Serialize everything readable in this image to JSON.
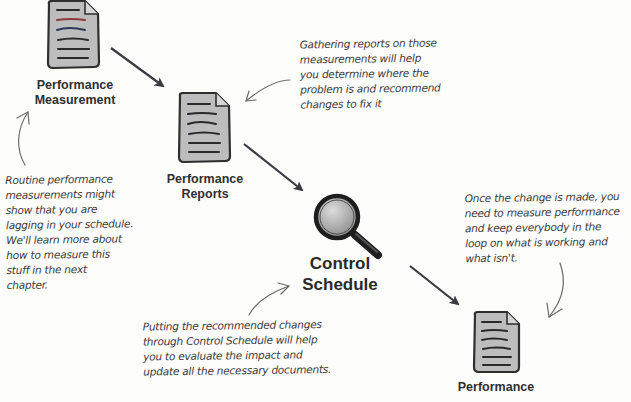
{
  "diagram": {
    "type": "process-flow",
    "nodes": [
      {
        "id": "performance-measurement",
        "label": "Performance\nMeasurement",
        "icon": "document-icon"
      },
      {
        "id": "performance-reports",
        "label": "Performance\nReports",
        "icon": "document-icon"
      },
      {
        "id": "control-schedule",
        "label": "Control\nSchedule",
        "icon": "magnifying-glass-icon"
      },
      {
        "id": "performance-bottom",
        "label": "Performance",
        "icon": "document-icon"
      }
    ],
    "edges": [
      {
        "from": "performance-measurement",
        "to": "performance-reports"
      },
      {
        "from": "performance-reports",
        "to": "control-schedule"
      },
      {
        "from": "control-schedule",
        "to": "performance-bottom"
      }
    ],
    "notes": [
      {
        "id": "note-reports",
        "text": "Gathering reports on those\nmeasurements will help\nyou determine where the\nproblem is and recommend\nchanges to fix it",
        "points_to": "performance-reports"
      },
      {
        "id": "note-measurement",
        "text": "Routine performance\nmeasurements might\nshow that you are\nlagging in your schedule.\nWe'll learn more about\nhow to measure this\nstuff in the next\nchapter.",
        "points_to": "performance-measurement"
      },
      {
        "id": "note-change",
        "text": "Once the change is made, you\nneed to measure performance\nand keep everybody in the\nloop on what is working and\nwhat isn't.",
        "points_to": "performance-bottom"
      },
      {
        "id": "note-control",
        "text": "Putting the recommended changes\nthrough Control Schedule will help\nyou to evaluate the impact and\nupdate all the necessary documents.",
        "points_to": "control-schedule"
      }
    ]
  },
  "colors": {
    "arrow": "#3a3a40",
    "note_text": "#3a3a3a",
    "doc_fill": "#bdbdbd",
    "doc_stroke": "#2e2e2e",
    "label": "#2f2f2f"
  }
}
